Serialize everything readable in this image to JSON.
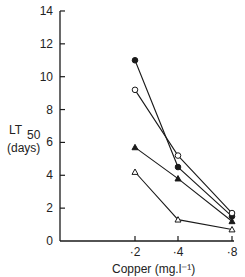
{
  "chart_data": {
    "type": "line",
    "title": "",
    "xlabel": "Copper (mg.l⁻¹)",
    "ylabel": "LT50 (days)",
    "ylabel_main": "LT",
    "ylabel_sub": "50",
    "ylabel_units": "(days)",
    "ylim": [
      0,
      14
    ],
    "yticks": [
      0,
      2,
      4,
      6,
      8,
      10,
      12,
      14
    ],
    "categories": [
      "·2",
      "·4",
      "·8"
    ],
    "x": [
      0.2,
      0.4,
      0.8
    ],
    "grid": false,
    "legend": null,
    "series": [
      {
        "name": "filled-circle",
        "marker": "filled-circle",
        "values": [
          11.0,
          4.5,
          1.5
        ]
      },
      {
        "name": "open-circle",
        "marker": "open-circle",
        "values": [
          9.2,
          5.2,
          1.7
        ]
      },
      {
        "name": "filled-triangle",
        "marker": "filled-triangle",
        "values": [
          5.7,
          3.8,
          1.2
        ]
      },
      {
        "name": "open-triangle",
        "marker": "open-triangle",
        "values": [
          4.2,
          1.3,
          0.7
        ]
      }
    ]
  },
  "colors": {
    "ink": "#1a1a1a",
    "background": "#ffffff"
  }
}
